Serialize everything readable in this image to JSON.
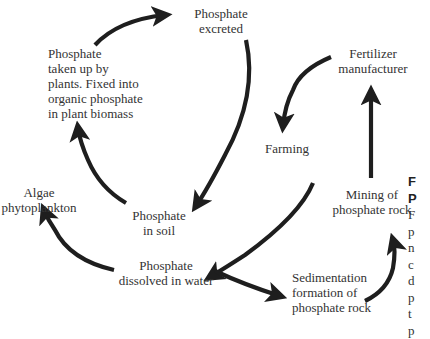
{
  "diagram": {
    "type": "cycle",
    "nodes": {
      "excreted": {
        "line1": "Phosphate",
        "line2": "excreted"
      },
      "plants": {
        "line1": "Phosphate",
        "line2": "taken up by",
        "line3": "plants. Fixed into",
        "line4": "organic phosphate",
        "line5": "in plant biomass"
      },
      "fertilizer": {
        "line1": "Fertilizer",
        "line2": "manufacturer"
      },
      "farming": {
        "line1": "Farming"
      },
      "algae": {
        "line1": "Algae",
        "line2": "phytoplankton"
      },
      "soil": {
        "line1": "Phosphate",
        "line2": "in soil"
      },
      "mining": {
        "line1": "Mining of",
        "line2": "phosphate rock"
      },
      "dissolved": {
        "line1": "Phosphate",
        "line2": "dissolved in water"
      },
      "sediment": {
        "line1": "Sedimentation",
        "line2": "formation of",
        "line3": "phosphate rock"
      }
    },
    "edges": [
      {
        "from": "Phosphate taken up by plants",
        "to": "Phosphate excreted"
      },
      {
        "from": "Phosphate excreted",
        "to": "Phosphate in soil"
      },
      {
        "from": "Phosphate in soil",
        "to": "Phosphate taken up by plants"
      },
      {
        "from": "Fertilizer manufacturer",
        "to": "Farming"
      },
      {
        "from": "Farming",
        "to": "Phosphate dissolved in water"
      },
      {
        "from": "Phosphate dissolved in water",
        "to": "Algae phytoplankton"
      },
      {
        "from": "Phosphate dissolved in water",
        "to": "Sedimentation formation of phosphate rock"
      },
      {
        "from": "Sedimentation formation of phosphate rock",
        "to": "Mining of phosphate rock"
      },
      {
        "from": "Mining of phosphate rock",
        "to": "Fertilizer manufacturer"
      }
    ],
    "arrow_color": "#1e1e1e",
    "text_color": "#333333"
  },
  "caption": {
    "title_line1": "F",
    "title_line2": "P",
    "body_lines": [
      "F",
      "p",
      "n",
      "c",
      "d",
      "p",
      "t",
      "p"
    ]
  }
}
